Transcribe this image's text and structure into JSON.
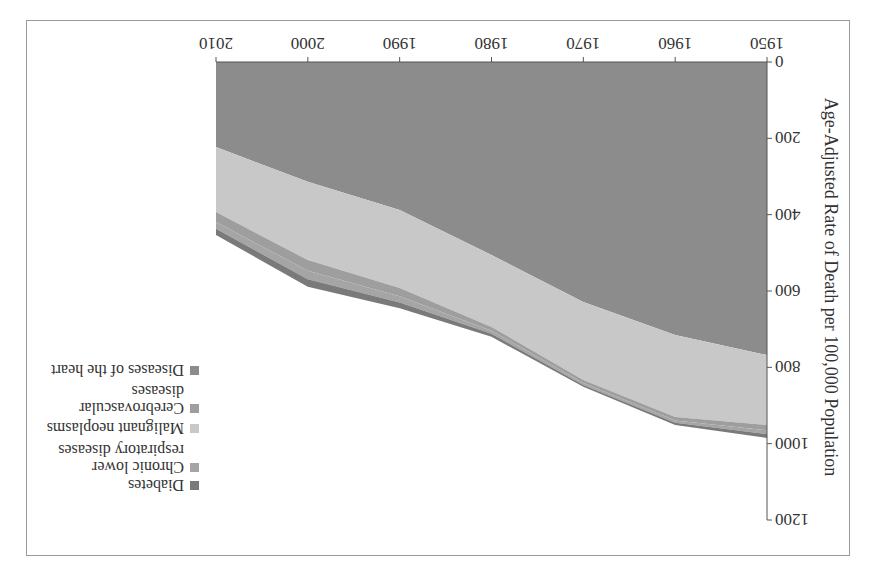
{
  "chart_data": {
    "type": "area",
    "stacked": true,
    "title": "",
    "xlabel": "",
    "ylabel": "Age-Adjusted Rate of Death per 100,000 Population",
    "x": [
      1950,
      1960,
      1970,
      1980,
      1990,
      2000,
      2010
    ],
    "xticks": [
      "1950",
      "1960",
      "1970",
      "1980",
      "1990",
      "2000",
      "2010"
    ],
    "yticks": [
      "0",
      "200",
      "400",
      "600",
      "800",
      "1000",
      "1200"
    ],
    "ylim": [
      0,
      1200
    ],
    "grid": false,
    "legend_position": "right",
    "orientation_note": "image is rotated 180 degrees",
    "series": [
      {
        "name": "Diseases of the heart",
        "color": "#8c8c8c",
        "values": [
          768,
          715,
          629,
          506,
          388,
          314,
          223
        ]
      },
      {
        "name": "Malignant neoplasms",
        "color": "#c8c8c8",
        "values": [
          183,
          215,
          204,
          188,
          204,
          205,
          170
        ]
      },
      {
        "name": "Cerebrovascular diseases",
        "color": "#9e9e9e",
        "values": [
          14,
          9,
          8,
          10,
          22,
          28,
          26
        ]
      },
      {
        "name": "Chronic lower respiratory diseases",
        "color": "#a5a5a5",
        "values": [
          10,
          6,
          5,
          8,
          16,
          22,
          18
        ]
      },
      {
        "name": "Diabetes",
        "color": "#7a7a7a",
        "values": [
          10,
          6,
          5,
          8,
          15,
          20,
          16
        ]
      }
    ]
  },
  "legend": {
    "items": [
      {
        "label_lines": [
          "Diabetes"
        ],
        "color": "#7a7a7a"
      },
      {
        "label_lines": [
          "Chronic lower",
          "respiratory diseases"
        ],
        "color": "#a5a5a5"
      },
      {
        "label_lines": [
          "Malignant neoplasms"
        ],
        "color": "#c8c8c8"
      },
      {
        "label_lines": [
          "Cerebrovascular",
          "diseases"
        ],
        "color": "#9e9e9e"
      },
      {
        "label_lines": [
          "Diseases of the heart"
        ],
        "color": "#8c8c8c"
      }
    ]
  }
}
